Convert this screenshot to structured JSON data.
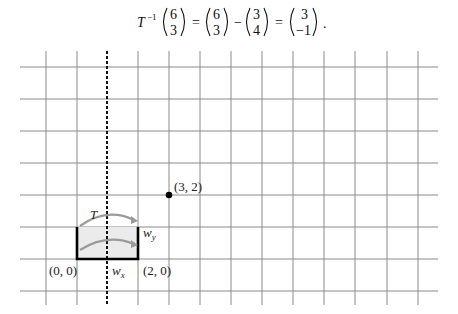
{
  "equation": {
    "operator": "T",
    "superscript": "−1",
    "vectors": [
      {
        "top": "6",
        "bottom": "3"
      },
      {
        "top": "6",
        "bottom": "3"
      },
      {
        "top": "3",
        "bottom": "4"
      },
      {
        "top": "3",
        "bottom": "−1"
      }
    ],
    "symbols": [
      "=",
      "−",
      "="
    ],
    "terminator": "."
  },
  "diagram": {
    "grid": {
      "vertical_x": [
        46,
        77,
        107,
        138,
        169,
        200,
        231,
        262,
        293,
        324,
        355,
        387,
        418
      ],
      "horizontal_y": [
        67,
        99,
        131,
        163,
        195,
        227,
        259,
        291
      ],
      "dashed_x": 107,
      "line_color": "#8a8a8a"
    },
    "point": {
      "label": "(3, 2)",
      "x": 169,
      "y": 195
    },
    "rectangle": {
      "x1": 77,
      "y1": 227,
      "x2": 138,
      "y2": 259,
      "fill": "#ebebeb"
    },
    "arrow_color": "#9a9a9a",
    "labels": {
      "transform": "T",
      "origin": "(0, 0)",
      "corner": "(2, 0)",
      "wx_base": "w",
      "wx_sub": "x",
      "wy_base": "w",
      "wy_sub": "y"
    }
  }
}
